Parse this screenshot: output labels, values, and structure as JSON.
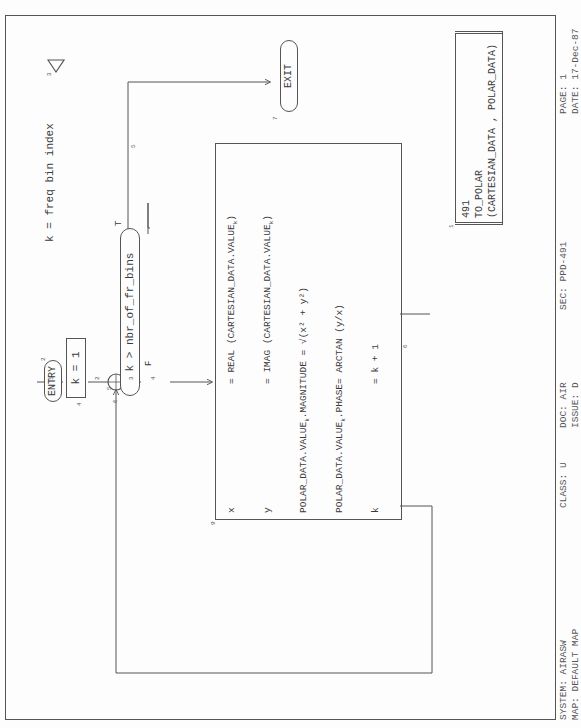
{
  "annotation": {
    "number": "3",
    "line1": "k = freq bin index",
    "line2": "(k=1,2,...,nbr_of_fr_bins)"
  },
  "entry": {
    "label": "ENTRY",
    "number": "2"
  },
  "exit": {
    "label": "EXIT",
    "number": "7"
  },
  "init_box": {
    "label": "k = 1",
    "number": "4"
  },
  "decision": {
    "label": "k > nbr_of_fr_bins",
    "number": "6",
    "true_label": "T",
    "false_label": "F"
  },
  "flow_numbers": {
    "f1": "1",
    "f2": "2",
    "f3": "3",
    "f4": "4",
    "f5": "5",
    "f6": "6",
    "f5b": "5",
    "f9": "9"
  },
  "process": {
    "rows": [
      {
        "lhs": "x",
        "rhs": "= REAL (CARTESIAN_DATA.VALUE",
        "sub": "k",
        "tail": ")"
      },
      {
        "lhs": "y",
        "rhs": "= IMAG (CARTESIAN_DATA.VALUE",
        "sub": "k",
        "tail": ")"
      },
      {
        "lhs": "POLAR_DATA.VALUE",
        "lhs_sub": "k",
        "lhs_tail": ".MAGNITUDE",
        "rhs": "= √(x² + y²)"
      },
      {
        "lhs": "POLAR_DATA.VALUE",
        "lhs_sub": "k",
        "lhs_tail": ".PHASE",
        "rhs": "= ARCTAN (y/x)"
      },
      {
        "lhs": "k",
        "rhs": "= k + 1"
      }
    ]
  },
  "title_box": {
    "number": "1",
    "line1": "491",
    "line2": "TO_POLAR",
    "line3": "(CARTESIAN_DATA , POLAR_DATA)"
  },
  "footer": {
    "system": "SYSTEM: AIRASW",
    "map": "MAP: DEFAULT MAP",
    "class": "CLASS: U",
    "doc": "DOC: AIR",
    "issue": "ISSUE: D",
    "sec": "SEC: PPD-491",
    "page": "PAGE: 1",
    "date": "DATE: 17-Dec-87"
  }
}
